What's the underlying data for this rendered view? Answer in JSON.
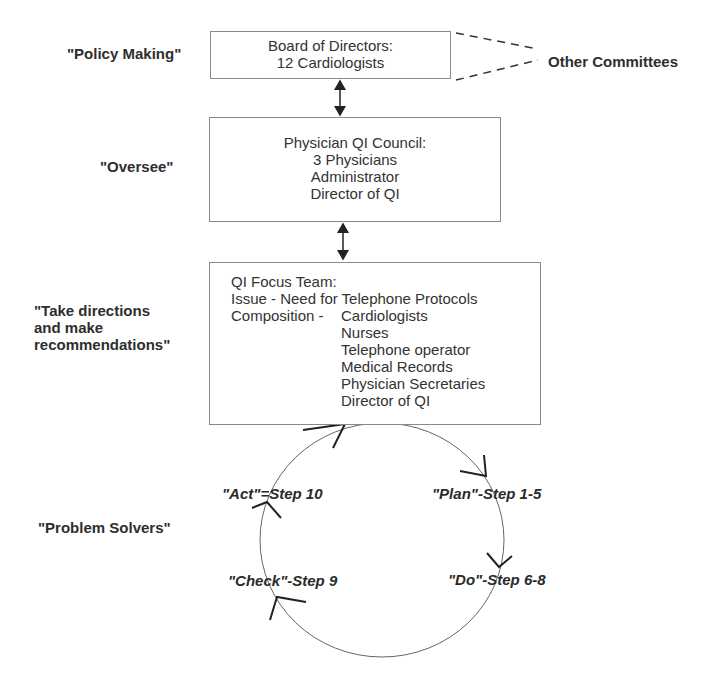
{
  "roles": {
    "policy": "\"Policy Making\"",
    "oversee": "\"Oversee\"",
    "take_directions": [
      "\"Take directions",
      "and make",
      "recommendations\""
    ],
    "problem_solvers": "\"Problem Solvers\""
  },
  "board": {
    "title": "Board of Directors:",
    "members": "12 Cardiologists"
  },
  "other_committees": "Other Committees",
  "council": {
    "title": "Physician QI Council:",
    "members": [
      "3 Physicians",
      "Administrator",
      "Director of QI"
    ]
  },
  "focus_team": {
    "title": "QI Focus Team:",
    "issue": "Issue - Need for Telephone Protocols",
    "composition_label": "Composition -",
    "composition": [
      "Cardiologists",
      "Nurses",
      "Telephone operator",
      "Medical Records",
      "Physician Secretaries",
      "Director of QI"
    ]
  },
  "pdca": {
    "act": "\"Act\"=Step 10",
    "plan": "\"Plan\"-Step 1-5",
    "do": "\"Do\"-Step 6-8",
    "check": "\"Check\"-Step 9"
  },
  "colors": {
    "line": "#333333",
    "box_border": "#8a8a8a",
    "text": "#2a2a2a"
  }
}
